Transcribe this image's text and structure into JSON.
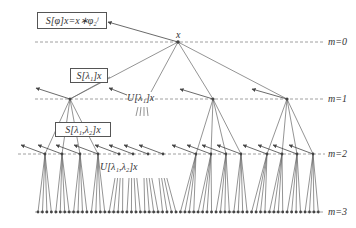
{
  "diagram": {
    "type": "scattering-transform-tree",
    "root_label": "x",
    "levels": [
      {
        "label": "m=0",
        "y": 42
      },
      {
        "label": "m=1",
        "y": 99
      },
      {
        "label": "m=2",
        "y": 154
      },
      {
        "label": "m=3",
        "y": 212
      }
    ],
    "boxes": [
      {
        "label": "S[φ]x=x∗φ₂ʲ"
      },
      {
        "label": "S[λ₁]x"
      },
      {
        "label": "S[λ₁,λ₂]x"
      }
    ],
    "annotations": [
      {
        "label": "U[λ₁]x"
      },
      {
        "label": "U[λ₁,λ₂]x"
      }
    ],
    "colors": {
      "line": "#666666",
      "node": "#444444",
      "dash": "#888888",
      "box_border": "#555555"
    }
  }
}
